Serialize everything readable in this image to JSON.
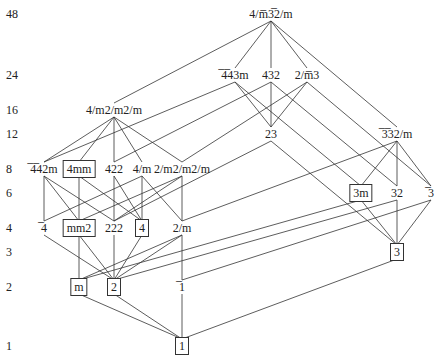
{
  "diagram": {
    "title": "",
    "orders": [
      {
        "label": "48",
        "y": 14
      },
      {
        "label": "24",
        "y": 75
      },
      {
        "label": "16",
        "y": 110
      },
      {
        "label": "12",
        "y": 134
      },
      {
        "label": "8",
        "y": 169
      },
      {
        "label": "6",
        "y": 193
      },
      {
        "label": "4",
        "y": 228
      },
      {
        "label": "3",
        "y": 252
      },
      {
        "label": "2",
        "y": 287
      },
      {
        "label": "1",
        "y": 346
      }
    ],
    "nodes": {
      "m3m": {
        "label": "4/m̅3̅2/m",
        "x": 271,
        "y": 14,
        "boxed": false
      },
      "b43m": {
        "label": "̅4̅43m",
        "x": 235,
        "y": 75,
        "boxed": false
      },
      "n432": {
        "label": "432",
        "x": 271,
        "y": 75,
        "boxed": false
      },
      "m3": {
        "label": "2/m̅3",
        "x": 307,
        "y": 75,
        "boxed": false
      },
      "n4mmm": {
        "label": "4/m2/m2/m",
        "x": 114,
        "y": 110,
        "boxed": false
      },
      "n23": {
        "label": "23",
        "x": 271,
        "y": 134,
        "boxed": false
      },
      "b3m": {
        "label": "̅3̅32/m",
        "x": 397,
        "y": 134,
        "boxed": false
      },
      "b42m": {
        "label": "̅4̅42m",
        "x": 44,
        "y": 169,
        "boxed": false
      },
      "n4mm": {
        "label": "4mm",
        "x": 79,
        "y": 169,
        "boxed": true
      },
      "n422": {
        "label": "422",
        "x": 114,
        "y": 169,
        "boxed": false
      },
      "n4m": {
        "label": "4/m",
        "x": 142,
        "y": 169,
        "boxed": false
      },
      "mmm": {
        "label": "2/m2/m2/m",
        "x": 182,
        "y": 169,
        "boxed": false
      },
      "n3m": {
        "label": "3m",
        "x": 361,
        "y": 193,
        "boxed": true
      },
      "n32": {
        "label": "32",
        "x": 397,
        "y": 193,
        "boxed": false
      },
      "b3": {
        "label": "̅3",
        "x": 431,
        "y": 193,
        "boxed": false
      },
      "b4": {
        "label": "̅4",
        "x": 44,
        "y": 228,
        "boxed": false
      },
      "mm2": {
        "label": "mm2",
        "x": 79,
        "y": 228,
        "boxed": true
      },
      "n222": {
        "label": "222",
        "x": 114,
        "y": 228,
        "boxed": false
      },
      "n4": {
        "label": "4",
        "x": 142,
        "y": 228,
        "boxed": true
      },
      "n2m": {
        "label": "2/m",
        "x": 182,
        "y": 228,
        "boxed": false
      },
      "n3": {
        "label": "3",
        "x": 397,
        "y": 252,
        "boxed": true
      },
      "m": {
        "label": "m",
        "x": 79,
        "y": 287,
        "boxed": true
      },
      "n2": {
        "label": "2",
        "x": 114,
        "y": 287,
        "boxed": true
      },
      "b1": {
        "label": "̅1",
        "x": 182,
        "y": 287,
        "boxed": false
      },
      "n1": {
        "label": "1",
        "x": 182,
        "y": 346,
        "boxed": true
      }
    },
    "edges": [
      [
        "m3m",
        "b43m"
      ],
      [
        "m3m",
        "n432"
      ],
      [
        "m3m",
        "m3"
      ],
      [
        "m3m",
        "n4mmm"
      ],
      [
        "m3m",
        "b3m"
      ],
      [
        "b43m",
        "n23"
      ],
      [
        "n432",
        "n23"
      ],
      [
        "m3",
        "n23"
      ],
      [
        "b43m",
        "b42m"
      ],
      [
        "n432",
        "n422"
      ],
      [
        "m3",
        "mmm"
      ],
      [
        "b43m",
        "n3m"
      ],
      [
        "n432",
        "n32"
      ],
      [
        "m3",
        "b3"
      ],
      [
        "n4mmm",
        "b42m"
      ],
      [
        "n4mmm",
        "n4mm"
      ],
      [
        "n4mmm",
        "n422"
      ],
      [
        "n4mmm",
        "n4m"
      ],
      [
        "n4mmm",
        "mmm"
      ],
      [
        "n23",
        "n222"
      ],
      [
        "n23",
        "n3"
      ],
      [
        "b3m",
        "n3m"
      ],
      [
        "b3m",
        "n32"
      ],
      [
        "b3m",
        "b3"
      ],
      [
        "b3m",
        "n2m"
      ],
      [
        "b42m",
        "b4"
      ],
      [
        "b42m",
        "mm2"
      ],
      [
        "b42m",
        "n222"
      ],
      [
        "n4mm",
        "mm2"
      ],
      [
        "n4mm",
        "n4"
      ],
      [
        "n422",
        "n222"
      ],
      [
        "n422",
        "n4"
      ],
      [
        "n4m",
        "b4"
      ],
      [
        "n4m",
        "n4"
      ],
      [
        "n4m",
        "n2m"
      ],
      [
        "mmm",
        "n222"
      ],
      [
        "mmm",
        "mm2"
      ],
      [
        "mmm",
        "n2m"
      ],
      [
        "n3m",
        "n3"
      ],
      [
        "n3m",
        "m"
      ],
      [
        "n32",
        "n3"
      ],
      [
        "n32",
        "n2"
      ],
      [
        "b3",
        "n3"
      ],
      [
        "b3",
        "b1"
      ],
      [
        "b4",
        "n2"
      ],
      [
        "mm2",
        "m"
      ],
      [
        "mm2",
        "n2"
      ],
      [
        "n222",
        "n2"
      ],
      [
        "n4",
        "n2"
      ],
      [
        "n2m",
        "m"
      ],
      [
        "n2m",
        "n2"
      ],
      [
        "n2m",
        "b1"
      ],
      [
        "n3",
        "n1"
      ],
      [
        "m",
        "n1"
      ],
      [
        "n2",
        "n1"
      ],
      [
        "b1",
        "n1"
      ]
    ]
  }
}
